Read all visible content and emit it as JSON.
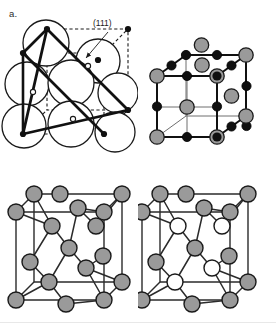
{
  "figure": {
    "background_color": "#ffffff",
    "width": 276,
    "height": 327
  },
  "palette": {
    "line": "#1a1a1a",
    "gray_atom_fill": "#9a9a9a",
    "gray_atom_stroke": "#1a1a1a",
    "black_atom_fill": "#101010",
    "white_atom_fill": "#ffffff",
    "dashed_line": "#1a1a1a",
    "thin_line": "#4d4d4d",
    "label_text": "#2b2b2b"
  },
  "panels": [
    {
      "id": "a",
      "label": "a.",
      "caption_text": "(111)",
      "structure_name": "face-centered-cubic-hard-sphere-111-plane",
      "description": "FCC unit cell drawn with hard-sphere atoms as large open circles, dashed cube edges, filled corner dots, open face-center dots, and a bold solid (111) plane triangle with an arrow pointing to it.",
      "atom_types": [
        {
          "name": "hard-sphere-atom",
          "render": "large open circle",
          "fill": "#ffffff",
          "stroke": "#1a1a1a"
        },
        {
          "name": "corner-site",
          "render": "small filled dot",
          "fill": "#101010"
        },
        {
          "name": "face-center-site",
          "render": "small open dot",
          "fill": "#ffffff"
        }
      ]
    },
    {
      "id": "b",
      "label": "b.",
      "structure_name": "rock-salt-sodium-chloride",
      "description": "Rock salt (NaCl) cubic unit cell: large gray spheres and small black spheres alternating on all cube edge and face positions, connected by straight bond lines.",
      "atom_types": [
        {
          "name": "cation-atom",
          "render": "large gray sphere",
          "fill": "#9a9a9a"
        },
        {
          "name": "anion-atom",
          "render": "small black sphere",
          "fill": "#101010"
        }
      ]
    },
    {
      "id": "c",
      "label": "c.",
      "structure_name": "diamond-cubic",
      "description": "Diamond cubic unit cell: all atoms identical gray spheres, tetrahedrally bonded, inside a thin-line cube outline.",
      "atom_types": [
        {
          "name": "carbon-atom",
          "render": "gray sphere",
          "fill": "#9a9a9a"
        }
      ]
    },
    {
      "id": "d",
      "label": "d.",
      "structure_name": "zinc-blende-sphalerite",
      "description": "Zinc blende (sphalerite) unit cell: gray spheres on the FCC sites and white spheres on the interior tetrahedral sites, tetrahedrally bonded, inside a thin-line cube outline.",
      "atom_types": [
        {
          "name": "gray-species-atom",
          "render": "gray sphere",
          "fill": "#9a9a9a"
        },
        {
          "name": "white-species-atom",
          "render": "white sphere",
          "fill": "#ffffff"
        }
      ]
    }
  ]
}
